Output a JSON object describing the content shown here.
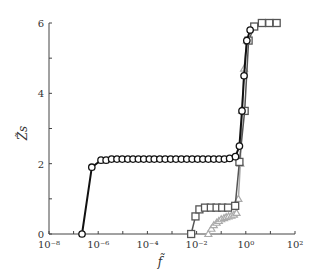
{
  "chart_data": {
    "type": "line",
    "title": "",
    "xlabel": "f̃",
    "ylabel": "Z̃s",
    "xscale": "log",
    "xlim": [
      1e-08,
      100
    ],
    "ylim": [
      0,
      6
    ],
    "grid": false,
    "legend": null,
    "x_ticks": [
      "10⁻⁸",
      "10⁻⁶",
      "10⁻⁴",
      "10⁻²",
      "10⁰",
      "10²"
    ],
    "y_ticks": [
      "0",
      "2",
      "4",
      "6"
    ],
    "series": [
      {
        "name": "circles",
        "marker": "circle",
        "color": "#111111",
        "x": [
          2.2e-07,
          5.5e-07,
          1.3e-06,
          2.1e-06,
          3.5e-06,
          5.8e-06,
          9.5e-06,
          1.6e-05,
          2.6e-05,
          4.3e-05,
          7.1e-05,
          0.00012,
          0.00019,
          0.00032,
          0.00053,
          0.00088,
          0.00145,
          0.0024,
          0.004,
          0.0066,
          0.011,
          0.018,
          0.03,
          0.05,
          0.082,
          0.135,
          0.22,
          0.38,
          0.55,
          0.7,
          0.85,
          1.1,
          1.5
        ],
        "values": [
          0,
          1.9,
          2.1,
          2.1,
          2.13,
          2.13,
          2.13,
          2.13,
          2.13,
          2.13,
          2.13,
          2.13,
          2.13,
          2.13,
          2.13,
          2.13,
          2.13,
          2.13,
          2.13,
          2.13,
          2.13,
          2.13,
          2.13,
          2.13,
          2.13,
          2.13,
          2.15,
          2.2,
          2.5,
          3.5,
          4.5,
          5.5,
          5.8
        ]
      },
      {
        "name": "squares",
        "marker": "square",
        "color": "#555555",
        "x": [
          0.006,
          0.009,
          0.013,
          0.022,
          0.038,
          0.065,
          0.11,
          0.19,
          0.37,
          0.55,
          0.9,
          1.3,
          2.2,
          4.5,
          9,
          18
        ],
        "values": [
          0,
          0.5,
          0.7,
          0.75,
          0.75,
          0.75,
          0.75,
          0.75,
          0.8,
          2.05,
          3.5,
          5.5,
          5.9,
          6.0,
          6.0,
          6.0
        ]
      },
      {
        "name": "triangles",
        "marker": "triangle",
        "color": "#aaaaaa",
        "x": [
          0.03,
          0.04,
          0.05,
          0.065,
          0.08,
          0.1,
          0.13,
          0.16,
          0.2,
          0.26,
          0.33,
          0.42,
          0.5,
          0.6,
          0.7,
          0.85,
          1.1
        ],
        "values": [
          0,
          0.15,
          0.25,
          0.32,
          0.37,
          0.42,
          0.45,
          0.48,
          0.5,
          0.52,
          0.55,
          0.6,
          1.0,
          2.0,
          3.5,
          4.7,
          5.5
        ]
      }
    ]
  }
}
